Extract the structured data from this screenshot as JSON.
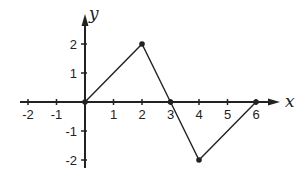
{
  "chart_data": {
    "type": "line",
    "title": "",
    "xlabel": "x",
    "ylabel": "y",
    "xlim": [
      -2,
      6
    ],
    "ylim": [
      -2,
      2
    ],
    "grid": false,
    "legend": null,
    "x_ticks": [
      -2,
      -1,
      1,
      2,
      3,
      4,
      5,
      6
    ],
    "x_tick_labels": [
      "-2",
      "-1",
      "1",
      "2",
      "3",
      "4",
      "5",
      "6"
    ],
    "y_ticks": [
      -2,
      -1,
      1,
      2
    ],
    "y_tick_labels": [
      "-2",
      "-1",
      "1",
      "2"
    ],
    "series": [
      {
        "name": "piecewise",
        "x": [
          0,
          2,
          3,
          4,
          6
        ],
        "y": [
          0,
          2,
          0,
          -2,
          0
        ],
        "markers": true
      }
    ]
  },
  "layout": {
    "origin_px": [
      85,
      102
    ],
    "unit_x_px": 28.5,
    "unit_y_px": 29,
    "x_axis_px": [
      20,
      280
    ],
    "y_axis_px": [
      168,
      14
    ],
    "stroke_color": "#222222"
  }
}
